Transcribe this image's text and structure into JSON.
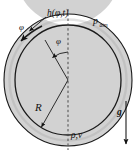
{
  "figure": {
    "name": "annular-liquid-film-schematic",
    "type": "technical-diagram",
    "background_color": "#ffffff",
    "ring": {
      "fill_color": "#d2d2d2",
      "stroke_color": "#1a1a1a",
      "center_x": 68,
      "center_y": 80,
      "outer_radius_x": 64,
      "outer_radius_y": 66,
      "inner_radius_x": 53,
      "inner_radius_y": 55
    },
    "labels": {
      "film_thickness": "h(φ,t)",
      "pressure_base": "p",
      "pressure_sub": "atm",
      "radius": "R",
      "angle": "φ",
      "angle_top_left": "φ",
      "density_velocity": "ρ,ν",
      "gravity": "g"
    },
    "annotations": {
      "centerline_style": "dashed-vertical",
      "centerline_color": "#4a4a4a",
      "gravity_arrow_direction": "down",
      "radius_arrow_direction": "down-left-to-inner-circle",
      "thickness_arrow_direction": "down-left-to-ring-wall",
      "angle_arc": "phi-measured-from-vertical-centerline"
    }
  }
}
